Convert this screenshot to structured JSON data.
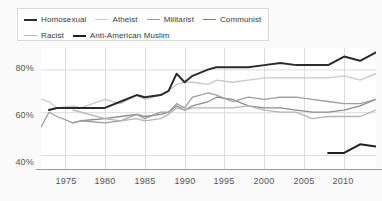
{
  "chart_data": {
    "type": "line",
    "title": "",
    "xlabel": "",
    "ylabel": "",
    "xlim": [
      1972,
      2014
    ],
    "ylim": [
      33,
      90
    ],
    "grid": true,
    "legend_position": "top-left",
    "ytick_labels": [
      "40%",
      "60%",
      "80%"
    ],
    "yticks": [
      40,
      60,
      80
    ],
    "xtick_labels": [
      "1975",
      "1980",
      "1985",
      "1990",
      "1995",
      "2000",
      "2005",
      "2010"
    ],
    "xticks": [
      1975,
      1980,
      1985,
      1990,
      1995,
      2000,
      2005,
      2010
    ],
    "series": [
      {
        "name": "Homosexual",
        "color": "#2b2b2b",
        "width": 2.0,
        "x": [
          1973,
          1974,
          1976,
          1977,
          1980,
          1982,
          1984,
          1985,
          1987,
          1988,
          1989,
          1990,
          1991,
          1993,
          1994,
          1996,
          1998,
          2000,
          2002,
          2004,
          2006,
          2008,
          2010,
          2012,
          2014
        ],
        "values": [
          61,
          62,
          62,
          62,
          62,
          65,
          68,
          67,
          68,
          70,
          78,
          74,
          77,
          80,
          81,
          81,
          81,
          82,
          83,
          82,
          82,
          82,
          86,
          84,
          88
        ]
      },
      {
        "name": "Atheist",
        "color": "#c9c9c9",
        "width": 1.3,
        "x": [
          1972,
          1973,
          1974,
          1976,
          1977,
          1980,
          1982,
          1984,
          1985,
          1987,
          1988,
          1989,
          1990,
          1991,
          1993,
          1994,
          1996,
          1998,
          2000,
          2002,
          2004,
          2006,
          2008,
          2010,
          2012,
          2014
        ],
        "values": [
          66,
          65,
          62,
          63,
          62,
          66,
          64,
          68,
          66,
          68,
          70,
          73,
          74,
          74,
          73,
          75,
          74,
          75,
          76,
          76,
          76,
          76,
          76,
          77,
          75,
          78
        ]
      },
      {
        "name": "Militarist",
        "color": "#8c8c8c",
        "width": 1.3,
        "x": [
          1976,
          1977,
          1980,
          1982,
          1984,
          1985,
          1987,
          1988,
          1989,
          1990,
          1991,
          1993,
          1994,
          1996,
          1998,
          2000,
          2002,
          2004,
          2006,
          2008,
          2010,
          2012,
          2014
        ],
        "values": [
          55,
          56,
          57,
          58,
          59,
          58,
          59,
          60,
          63,
          61,
          63,
          65,
          67,
          66,
          63,
          62,
          62,
          61,
          60,
          60,
          61,
          63,
          66
        ]
      },
      {
        "name": "Communist",
        "color": "#9f9f9f",
        "width": 1.3,
        "x": [
          1972,
          1973,
          1974,
          1976,
          1977,
          1980,
          1982,
          1984,
          1985,
          1987,
          1988,
          1989,
          1990,
          1991,
          1993,
          1994,
          1996,
          1998,
          2000,
          2002,
          2004,
          2006,
          2008,
          2010,
          2012,
          2014
        ],
        "values": [
          53,
          60,
          58,
          55,
          56,
          55,
          56,
          59,
          57,
          60,
          60,
          64,
          62,
          67,
          69,
          68,
          65,
          67,
          66,
          67,
          67,
          66,
          65,
          64,
          64,
          66
        ]
      },
      {
        "name": "Racist",
        "color": "#b5b5b5",
        "width": 1.3,
        "x": [
          1976,
          1977,
          1980,
          1982,
          1984,
          1985,
          1987,
          1988,
          1989,
          1990,
          1991,
          1993,
          1994,
          1996,
          1998,
          2000,
          2002,
          2004,
          2006,
          2008,
          2010,
          2012,
          2014
        ],
        "values": [
          61,
          60,
          57,
          56,
          57,
          56,
          57,
          59,
          62,
          61,
          62,
          62,
          62,
          62,
          63,
          61,
          60,
          60,
          57,
          58,
          58,
          58,
          61
        ]
      },
      {
        "name": "Anti-American Muslim",
        "color": "#202020",
        "width": 2.0,
        "x": [
          2008,
          2010,
          2012,
          2014
        ],
        "values": [
          41,
          41,
          45,
          44
        ]
      }
    ]
  },
  "legend": {
    "rows": [
      [
        {
          "label": "Homosexual",
          "color": "#2b2b2b",
          "thick": true
        },
        {
          "label": "Atheist",
          "color": "#c9c9c9",
          "thick": false
        },
        {
          "label": "Militarist",
          "color": "#9a9a9a",
          "thick": false
        },
        {
          "label": "Communist",
          "color": "#7d7d7d",
          "thick": false
        }
      ],
      [
        {
          "label": "Racist",
          "color": "#b5b5b5",
          "thick": false
        },
        {
          "label": "Anti-American Muslim",
          "color": "#202020",
          "thick": true
        }
      ]
    ]
  },
  "colors": {
    "background": "#fafafa",
    "plot_background": "#ffffff",
    "grid": "#dcdcdc",
    "axis": "#9a9a9a",
    "tick_text": "#555555",
    "legend_border": "#d9d9d9"
  }
}
